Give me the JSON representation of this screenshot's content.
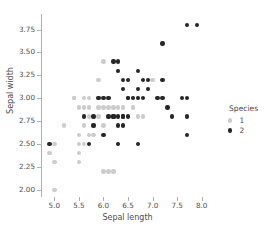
{
  "chart_data": {
    "type": "scatter",
    "title": "",
    "xlabel": "Sepal length",
    "ylabel": "Sepal width",
    "xlim": [
      4.75,
      8.25
    ],
    "ylim": [
      1.92,
      3.92
    ],
    "xticks": [
      "5.0",
      "5.5",
      "6.0",
      "6.5",
      "7.0",
      "7.5",
      "8.0"
    ],
    "xtick_values": [
      5.0,
      5.5,
      6.0,
      6.5,
      7.0,
      7.5,
      8.0
    ],
    "yticks": [
      "2.00",
      "2.25",
      "2.50",
      "2.75",
      "3.00",
      "3.25",
      "3.50",
      "3.75"
    ],
    "ytick_values": [
      2.0,
      2.25,
      2.5,
      2.75,
      3.0,
      3.25,
      3.5,
      3.75
    ],
    "grid": false,
    "legend": {
      "title": "Species",
      "position": "right",
      "entries": [
        {
          "label": "1",
          "color": "#cccccc"
        },
        {
          "label": "2",
          "color": "#262626"
        }
      ]
    },
    "series": [
      {
        "name": "1",
        "color": "#cccccc",
        "points": [
          [
            4.9,
            2.4
          ],
          [
            5.0,
            2.5
          ],
          [
            5.0,
            2.3
          ],
          [
            5.0,
            2.0
          ],
          [
            5.2,
            2.7
          ],
          [
            5.4,
            3.0
          ],
          [
            5.5,
            2.9
          ],
          [
            5.5,
            2.6
          ],
          [
            5.5,
            2.5
          ],
          [
            5.5,
            2.4
          ],
          [
            5.5,
            2.3
          ],
          [
            5.6,
            3.0
          ],
          [
            5.6,
            2.9
          ],
          [
            5.6,
            2.7
          ],
          [
            5.6,
            2.5
          ],
          [
            5.7,
            3.0
          ],
          [
            5.7,
            2.9
          ],
          [
            5.7,
            2.8
          ],
          [
            5.7,
            2.6
          ],
          [
            5.8,
            2.7
          ],
          [
            5.8,
            2.6
          ],
          [
            5.9,
            3.2
          ],
          [
            5.9,
            3.0
          ],
          [
            5.9,
            2.9
          ],
          [
            5.9,
            2.8
          ],
          [
            6.0,
            2.9
          ],
          [
            6.0,
            2.7
          ],
          [
            6.0,
            2.2
          ],
          [
            6.1,
            2.9
          ],
          [
            6.1,
            2.8
          ],
          [
            6.1,
            2.2
          ],
          [
            6.2,
            2.9
          ],
          [
            6.2,
            2.8
          ],
          [
            6.2,
            2.2
          ],
          [
            6.3,
            2.9
          ],
          [
            6.3,
            2.8
          ],
          [
            6.3,
            2.5
          ],
          [
            6.4,
            2.9
          ],
          [
            6.4,
            2.8
          ],
          [
            6.6,
            2.9
          ],
          [
            6.6,
            3.0
          ],
          [
            6.7,
            3.0
          ],
          [
            6.7,
            2.8
          ],
          [
            6.8,
            2.8
          ],
          [
            6.9,
            3.2
          ],
          [
            6.9,
            3.1
          ],
          [
            7.0,
            3.2
          ],
          [
            6.0,
            3.4
          ],
          [
            5.4,
            3.0
          ],
          [
            6.3,
            3.3
          ]
        ]
      },
      {
        "name": "2",
        "color": "#262626",
        "points": [
          [
            4.9,
            2.5
          ],
          [
            5.6,
            2.8
          ],
          [
            5.7,
            2.5
          ],
          [
            5.8,
            2.8
          ],
          [
            5.8,
            2.7
          ],
          [
            5.9,
            3.0
          ],
          [
            6.0,
            3.0
          ],
          [
            6.0,
            2.6
          ],
          [
            6.1,
            3.0
          ],
          [
            6.1,
            2.8
          ],
          [
            6.2,
            3.4
          ],
          [
            6.2,
            2.8
          ],
          [
            6.3,
            3.4
          ],
          [
            6.3,
            3.3
          ],
          [
            6.3,
            2.8
          ],
          [
            6.3,
            2.7
          ],
          [
            6.3,
            2.5
          ],
          [
            6.4,
            3.2
          ],
          [
            6.4,
            3.1
          ],
          [
            6.4,
            2.8
          ],
          [
            6.4,
            2.7
          ],
          [
            6.5,
            3.2
          ],
          [
            6.5,
            3.0
          ],
          [
            6.5,
            3.0
          ],
          [
            6.6,
            3.0
          ],
          [
            6.7,
            3.3
          ],
          [
            6.7,
            3.1
          ],
          [
            6.7,
            3.0
          ],
          [
            6.7,
            2.5
          ],
          [
            6.8,
            3.2
          ],
          [
            6.8,
            3.0
          ],
          [
            6.9,
            3.2
          ],
          [
            6.9,
            3.1
          ],
          [
            7.1,
            3.0
          ],
          [
            7.2,
            3.6
          ],
          [
            7.2,
            3.2
          ],
          [
            7.2,
            3.0
          ],
          [
            7.3,
            2.9
          ],
          [
            7.4,
            2.8
          ],
          [
            7.6,
            3.0
          ],
          [
            7.7,
            3.8
          ],
          [
            7.7,
            3.0
          ],
          [
            7.7,
            2.8
          ],
          [
            7.7,
            2.6
          ],
          [
            7.9,
            3.8
          ],
          [
            6.5,
            2.8
          ],
          [
            6.4,
            2.8
          ],
          [
            6.2,
            2.8
          ]
        ]
      }
    ]
  }
}
